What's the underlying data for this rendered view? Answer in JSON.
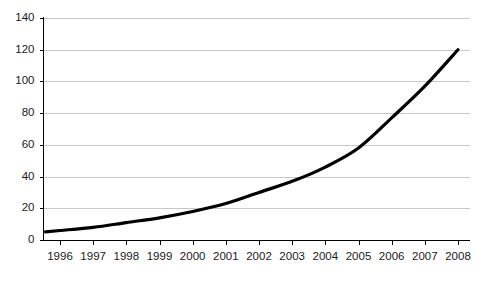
{
  "chart_data": {
    "type": "line",
    "title": "",
    "subtitle": "",
    "xlabel": "",
    "ylabel": "",
    "categories": [
      "1996",
      "1997",
      "1998",
      "1999",
      "2000",
      "2001",
      "2002",
      "2003",
      "2004",
      "2005",
      "2006",
      "2007",
      "2008"
    ],
    "x": [
      1996,
      1997,
      1998,
      1999,
      2000,
      2001,
      2002,
      2003,
      2004,
      2005,
      2006,
      2007,
      2008
    ],
    "values": [
      6,
      8,
      11,
      14,
      18,
      23,
      30,
      37,
      46,
      58,
      77,
      97,
      120
    ],
    "series": [
      {
        "name": "",
        "values": [
          6,
          8,
          11,
          14,
          18,
          23,
          30,
          37,
          46,
          58,
          77,
          97,
          120
        ],
        "color": "#000000"
      }
    ],
    "ylim": [
      0,
      140
    ],
    "yticks": [
      0,
      20,
      40,
      60,
      80,
      100,
      120,
      140
    ],
    "ytick_labels": [
      "0",
      "20",
      "40",
      "60",
      "80",
      "100",
      "120",
      "140"
    ],
    "xtick_labels": [
      "1996",
      "1997",
      "1998",
      "1999",
      "2000",
      "2001",
      "2002",
      "2003",
      "2004",
      "2005",
      "2006",
      "2007",
      "2008"
    ],
    "grid": true,
    "grid_axis": "y",
    "grid_color": "#c8c8c8",
    "legend": false,
    "legend_position": "none",
    "axis_color": "#000000",
    "background_color": "#ffffff",
    "annotations": []
  }
}
